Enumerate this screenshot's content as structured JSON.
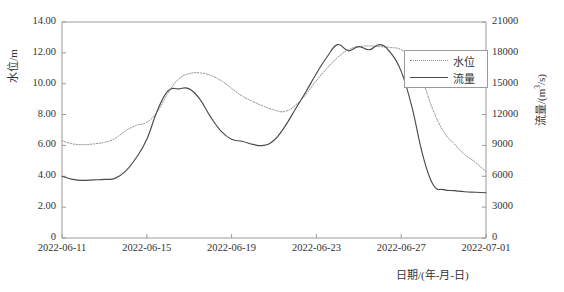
{
  "chart_data": {
    "type": "line",
    "title": "",
    "xlabel": "日期/(年-月-日)",
    "ylabel": "水位/m",
    "y2label": "流量/(m³/s)",
    "xlim": [
      "2022-06-11",
      "2022-07-01"
    ],
    "ylim": [
      0,
      14
    ],
    "y2lim": [
      0,
      21000
    ],
    "grid": false,
    "legend_position": "top-right-inside",
    "x_tick_labels": [
      "2022-06-11",
      "2022-06-15",
      "2022-06-19",
      "2022-06-23",
      "2022-06-27",
      "2022-07-01"
    ],
    "y_tick_labels": [
      "0",
      "2.00",
      "4.00",
      "6.00",
      "8.00",
      "10.00",
      "12.00",
      "14.00"
    ],
    "y_tick_values": [
      0,
      2,
      4,
      6,
      8,
      10,
      12,
      14
    ],
    "y2_tick_labels": [
      "0",
      "3000",
      "6000",
      "9000",
      "12000",
      "15000",
      "18000",
      "21000"
    ],
    "y2_tick_values": [
      0,
      3000,
      6000,
      9000,
      12000,
      15000,
      18000,
      21000
    ],
    "x": [
      "2022-06-11",
      "2022-06-11.5",
      "2022-06-12",
      "2022-06-12.5",
      "2022-06-13",
      "2022-06-13.5",
      "2022-06-14",
      "2022-06-14.5",
      "2022-06-15",
      "2022-06-15.5",
      "2022-06-16",
      "2022-06-16.5",
      "2022-06-17",
      "2022-06-17.5",
      "2022-06-18",
      "2022-06-18.5",
      "2022-06-19",
      "2022-06-19.5",
      "2022-06-20",
      "2022-06-20.5",
      "2022-06-21",
      "2022-06-21.5",
      "2022-06-22",
      "2022-06-22.5",
      "2022-06-23",
      "2022-06-23.5",
      "2022-06-24",
      "2022-06-24.5",
      "2022-06-25",
      "2022-06-25.5",
      "2022-06-26",
      "2022-06-26.5",
      "2022-06-27",
      "2022-06-27.5",
      "2022-06-28",
      "2022-06-28.5",
      "2022-06-29",
      "2022-06-29.5",
      "2022-06-30",
      "2022-06-30.5",
      "2022-07-01"
    ],
    "series": [
      {
        "name": "水位",
        "unit": "m",
        "axis": "left",
        "style": "dotted",
        "color": "#8d8d8d",
        "values": [
          6.3,
          6.1,
          6.05,
          6.1,
          6.2,
          6.45,
          6.95,
          7.3,
          7.5,
          8.2,
          9.4,
          10.3,
          10.65,
          10.7,
          10.55,
          10.2,
          9.7,
          9.2,
          8.85,
          8.55,
          8.3,
          8.2,
          8.6,
          9.3,
          10.2,
          11.0,
          11.7,
          12.2,
          12.4,
          12.45,
          12.4,
          12.35,
          12.2,
          11.6,
          10.2,
          8.3,
          6.9,
          6.1,
          5.4,
          4.9,
          4.3
        ]
      },
      {
        "name": "流量",
        "unit": "m³/s",
        "axis": "right",
        "style": "solid",
        "color": "#4a4a4a",
        "values": [
          6000,
          5700,
          5600,
          5650,
          5700,
          5800,
          6500,
          7800,
          9600,
          12400,
          14300,
          14500,
          14500,
          13500,
          11800,
          10400,
          9600,
          9400,
          9100,
          9000,
          9500,
          10800,
          12500,
          14200,
          16000,
          17600,
          18800,
          18200,
          18600,
          18300,
          18800,
          18000,
          16200,
          12800,
          8200,
          5200,
          4700,
          4600,
          4500,
          4450,
          4400
        ]
      }
    ]
  },
  "legend": {
    "items": [
      {
        "label": "水位",
        "style": "dotted"
      },
      {
        "label": "流量",
        "style": "solid"
      }
    ]
  },
  "axes": {
    "left_title": "水位/m",
    "right_title_prefix": "流量/(m",
    "right_title_sup": "3",
    "right_title_suffix": "/s)",
    "bottom_title": "日期/(年-月-日)"
  }
}
